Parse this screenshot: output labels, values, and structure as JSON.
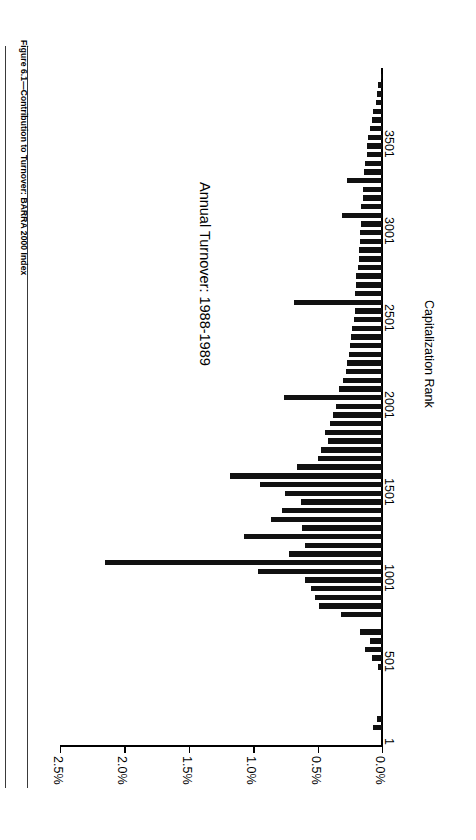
{
  "page": {
    "figure_title": "Figure 6.1—Contribution to Turnover: BARRA 2000 Index"
  },
  "chart_data": {
    "type": "bar",
    "orientation": "vertical-rotated",
    "title": "Figure 6.1—Contribution to Turnover: BARRA 2000 Index",
    "annotation": "Annual Turnover: 1988-1989",
    "xlabel": "Capitalization Rank",
    "ylabel": "",
    "xticks": [
      "1",
      "501",
      "1001",
      "1501",
      "2001",
      "2501",
      "3001",
      "3501"
    ],
    "xtick_values": [
      1,
      501,
      1001,
      1501,
      2001,
      2501,
      3001,
      3501
    ],
    "yticks": [
      "0.0%",
      "0.5%",
      "1.0%",
      "1.5%",
      "2.0%",
      "2.5%"
    ],
    "ytick_values": [
      0.0,
      0.5,
      1.0,
      1.5,
      2.0,
      2.5
    ],
    "ylim": [
      0.0,
      2.5
    ],
    "xlim": [
      1,
      3900
    ],
    "grid": false,
    "legend": null,
    "bar_color": "#111111",
    "categories": [
      1,
      51,
      101,
      151,
      201,
      251,
      301,
      351,
      401,
      451,
      501,
      551,
      601,
      651,
      701,
      751,
      801,
      851,
      901,
      951,
      1001,
      1051,
      1101,
      1151,
      1201,
      1251,
      1301,
      1351,
      1401,
      1451,
      1501,
      1551,
      1601,
      1651,
      1701,
      1751,
      1801,
      1851,
      1901,
      1951,
      2001,
      2051,
      2101,
      2151,
      2201,
      2251,
      2301,
      2351,
      2401,
      2451,
      2501,
      2551,
      2601,
      2651,
      2701,
      2751,
      2801,
      2851,
      2901,
      2951,
      3001,
      3051,
      3101,
      3151,
      3201,
      3251,
      3301,
      3351,
      3401,
      3451,
      3501,
      3551,
      3601,
      3651,
      3701,
      3751,
      3801,
      3851
    ],
    "values": [
      0.0,
      0.0,
      0.07,
      0.04,
      0.0,
      0.0,
      0.0,
      0.0,
      0.0,
      0.03,
      0.08,
      0.13,
      0.09,
      0.17,
      0.0,
      0.32,
      0.49,
      0.52,
      0.55,
      0.6,
      0.96,
      2.15,
      0.72,
      0.6,
      1.07,
      0.62,
      0.86,
      0.78,
      0.63,
      0.75,
      0.95,
      1.18,
      0.66,
      0.5,
      0.47,
      0.42,
      0.44,
      0.4,
      0.38,
      0.36,
      0.76,
      0.33,
      0.3,
      0.28,
      0.27,
      0.26,
      0.25,
      0.24,
      0.23,
      0.22,
      0.21,
      0.68,
      0.21,
      0.2,
      0.2,
      0.19,
      0.18,
      0.18,
      0.17,
      0.17,
      0.16,
      0.31,
      0.16,
      0.15,
      0.15,
      0.27,
      0.14,
      0.13,
      0.12,
      0.12,
      0.11,
      0.09,
      0.08,
      0.07,
      0.05,
      0.04,
      0.03,
      0.01
    ]
  }
}
